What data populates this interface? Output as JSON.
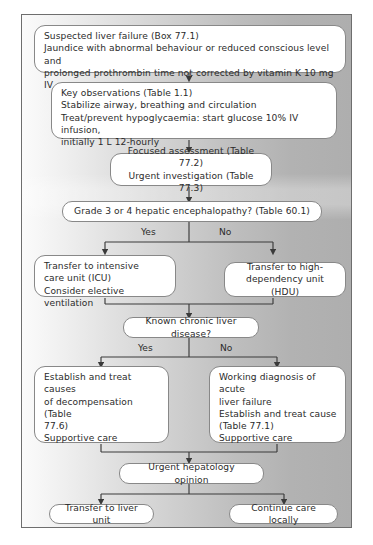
{
  "diagram": {
    "colors": {
      "node_fill": "#ffffff",
      "node_border": "#888888",
      "text": "#2b2b2b",
      "line": "#3a3a3a",
      "panel_border": "#6e6e6e",
      "background_left": "#fbfbfb",
      "background_right": "#aeaeae"
    },
    "nodes": {
      "suspected": "Suspected liver failure (Box 77.1)\nJaundice with abnormal behaviour or reduced conscious level and\nprolonged prothrombin time not corrected by vitamin K 10 mg IV",
      "key_observations": "Key observations (Table 1.1)\nStabilize airway, breathing and circulation\nTreat/prevent hypoglycaemia: start glucose 10% IV infusion,\ninitially 1 L 12-hourly",
      "focused_assessment": "Focused assessment (Table 77.2)\nUrgent investigation (Table 77.3)",
      "encephalopathy_decision": "Grade 3 or 4 hepatic encephalopathy? (Table 60.1)",
      "transfer_icu": "Transfer to intensive\ncare unit (ICU)\nConsider elective ventilation",
      "transfer_hdu": "Transfer to high-\ndependency unit (HDU)",
      "chronic_decision": "Known chronic liver disease?",
      "decompensation": "Establish and treat causes\nof decompensation (Table\n77.6)\nSupportive care",
      "acute_liver_failure": "Working diagnosis of acute\nliver failure\nEstablish and treat cause\n(Table 77.1)\nSupportive care",
      "hepatology_opinion": "Urgent hepatology opinion",
      "transfer_liver_unit": "Transfer to liver unit",
      "continue_locally": "Continue care locally"
    },
    "branch_labels": {
      "encephalopathy_yes": "Yes",
      "encephalopathy_no": "No",
      "chronic_yes": "Yes",
      "chronic_no": "No"
    }
  }
}
